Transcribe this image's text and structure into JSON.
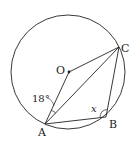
{
  "diagram": {
    "type": "circle-geometry",
    "colors": {
      "stroke": "#222222",
      "background": "#ffffff"
    },
    "circle": {
      "cx": 68,
      "cy": 72,
      "r": 57
    },
    "points": {
      "O": {
        "label": "O",
        "x": 69,
        "y": 72
      },
      "A": {
        "label": "A",
        "x": 45,
        "y": 124
      },
      "B": {
        "label": "B",
        "x": 106,
        "y": 117
      },
      "C": {
        "label": "C",
        "x": 119,
        "y": 47
      }
    },
    "segments": [
      "OA",
      "OC",
      "AC",
      "AB",
      "BC"
    ],
    "angles": {
      "OAC": {
        "label": "18°",
        "vertex": "A"
      },
      "ABC": {
        "label": "x",
        "vertex": "B"
      }
    }
  }
}
